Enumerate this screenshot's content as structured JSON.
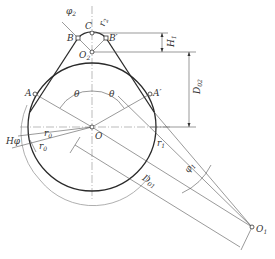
{
  "figure": {
    "type": "geometric construction diagram",
    "points": {
      "O": {
        "label": "O",
        "sub": ""
      },
      "O1": {
        "label": "O",
        "sub": "1"
      },
      "O2": {
        "label": "O",
        "sub": "2"
      },
      "A": {
        "label": "A",
        "sub": ""
      },
      "A_prime": {
        "label": "A′",
        "sub": ""
      },
      "B": {
        "label": "B",
        "sub": ""
      },
      "B_prime": {
        "label": "B′",
        "sub": ""
      },
      "C": {
        "label": "C",
        "sub": ""
      }
    },
    "dimensions": {
      "H1": {
        "label": "H",
        "sub": "1"
      },
      "D02": {
        "label": "D",
        "sub": "02"
      },
      "D01": {
        "label": "D",
        "sub": "01"
      },
      "Hphi": {
        "label": "Hφ",
        "sub": ""
      },
      "r0_upper": {
        "label": "r",
        "sub": "0"
      },
      "r0_lower": {
        "label": "r",
        "sub": "0"
      },
      "r1": {
        "label": "r",
        "sub": "1"
      },
      "r2": {
        "label": "r",
        "sub": "2"
      },
      "theta_left": {
        "label": "θ",
        "sub": ""
      },
      "theta_right": {
        "label": "θ",
        "sub": ""
      },
      "phi1": {
        "label": "φ",
        "sub": "1"
      },
      "phi2": {
        "label": "φ",
        "sub": "2"
      }
    }
  }
}
